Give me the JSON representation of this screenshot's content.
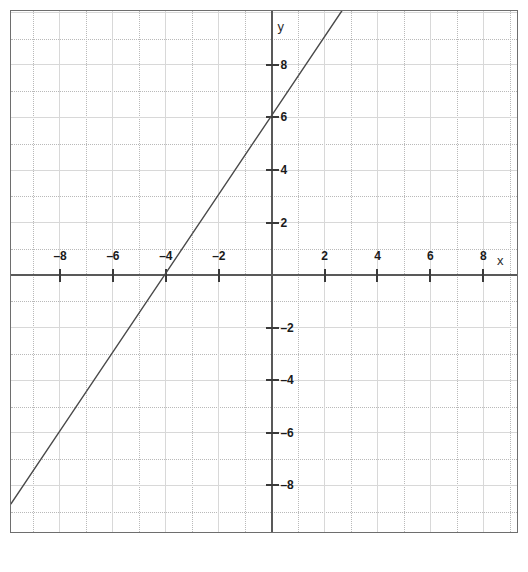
{
  "chart_data": {
    "type": "line",
    "title": "",
    "subtitle": "",
    "xlabel": "x",
    "ylabel": "y",
    "xlim": [
      -9.85,
      9.35
    ],
    "ylim": [
      -9.85,
      10.05
    ],
    "grid": true,
    "minor_grid": true,
    "minor_step": 1,
    "major_step": 2,
    "legend": "none",
    "x_ticks": [
      -8,
      -6,
      -4,
      -2,
      2,
      4,
      6,
      8
    ],
    "x_tick_labels": [
      "–8",
      "–6",
      "–4",
      "–2",
      "2",
      "4",
      "6",
      "8"
    ],
    "y_ticks": [
      8,
      6,
      4,
      2,
      -2,
      -4,
      -6,
      -8
    ],
    "y_tick_labels": [
      "8",
      "6",
      "4",
      "2",
      "–2",
      "–4",
      "–6",
      "–8"
    ],
    "series": [
      {
        "name": "line",
        "equation": "y = 1.5x + 6",
        "slope": 1.5,
        "intercept": 6,
        "x_intercept": -4,
        "y_intercept": 6,
        "color": "#4a4a4a",
        "points": [
          {
            "x": -9.85,
            "y": -8.775
          },
          {
            "x": -8,
            "y": -6
          },
          {
            "x": -6,
            "y": -3
          },
          {
            "x": -4,
            "y": 0
          },
          {
            "x": -2,
            "y": 3
          },
          {
            "x": 0,
            "y": 6
          },
          {
            "x": 2.7,
            "y": 10.05
          }
        ]
      }
    ]
  },
  "axes": {
    "x_name": "x",
    "y_name": "y"
  },
  "style": {
    "axis_color": "#595959",
    "grid_major_color": "#d8d8d8",
    "grid_minor_color": "#b9b9b9",
    "line_color": "#4a4a4a",
    "border_color": "#6e6e6e",
    "background": "#ffffff",
    "label_color": "#1a1a1a"
  }
}
